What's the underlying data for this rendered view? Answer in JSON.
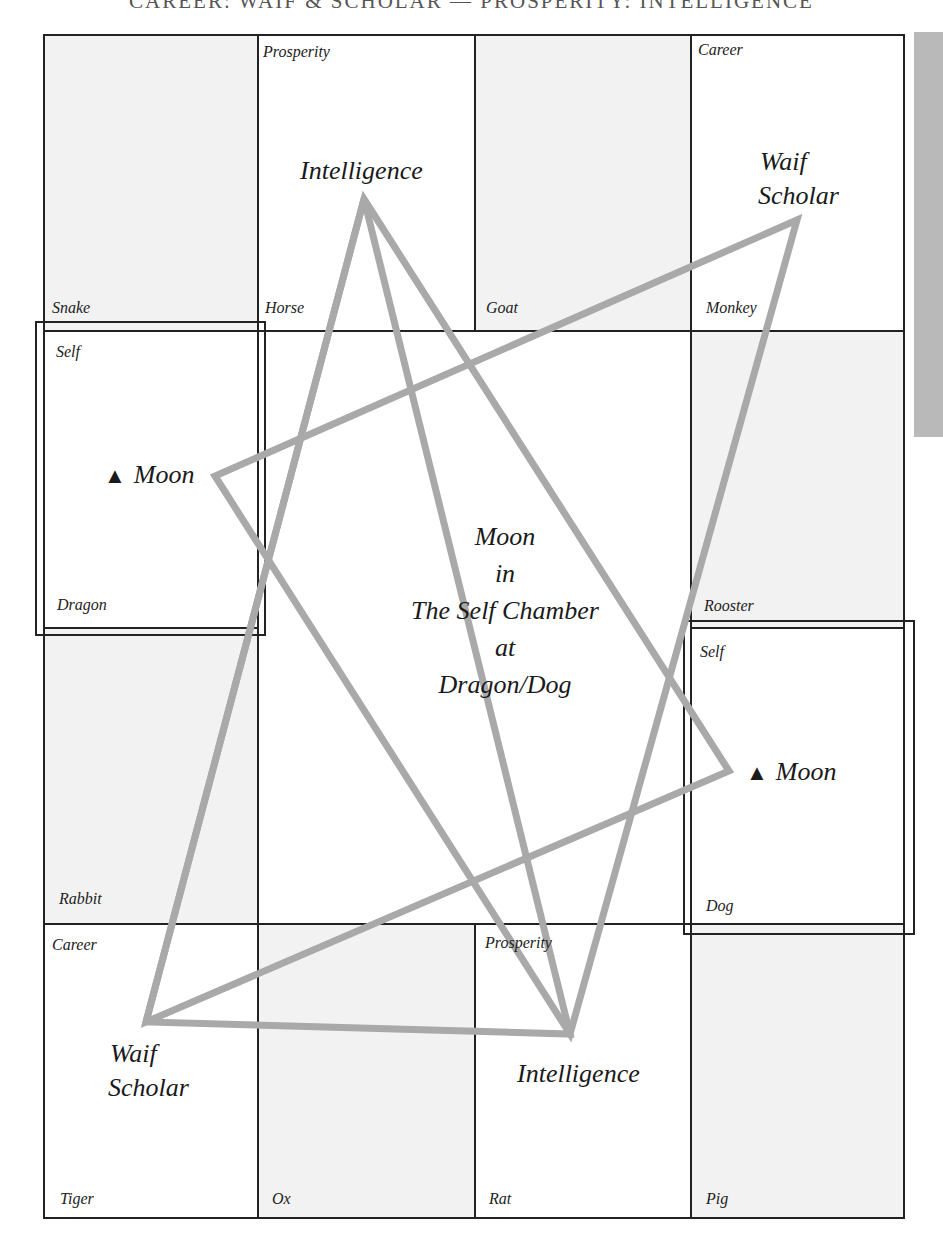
{
  "header": {
    "title": "CAREER: WAIF & SCHOLAR — PROSPERITY: INTELLIGENCE"
  },
  "grid": {
    "cells": {
      "snake": {
        "animal": "Snake"
      },
      "horse": {
        "animal": "Horse",
        "chamber": "Prosperity",
        "star": "Intelligence"
      },
      "goat": {
        "animal": "Goat"
      },
      "monkey": {
        "animal": "Monkey",
        "chamber": "Career",
        "star_line1": "Waif",
        "star_line2": "Scholar"
      },
      "dragon": {
        "animal": "Dragon",
        "chamber": "Self",
        "star": "Moon",
        "marker": "▲"
      },
      "rooster": {
        "animal": "Rooster"
      },
      "rabbit": {
        "animal": "Rabbit"
      },
      "dog": {
        "animal": "Dog",
        "chamber": "Self",
        "star": "Moon",
        "marker": "▲"
      },
      "tiger": {
        "animal": "Tiger",
        "chamber": "Career",
        "star_line1": "Waif",
        "star_line2": "Scholar"
      },
      "ox": {
        "animal": "Ox"
      },
      "rat": {
        "animal": "Rat",
        "chamber": "Prosperity",
        "star": "Intelligence"
      },
      "pig": {
        "animal": "Pig"
      }
    },
    "center": {
      "line1": "Moon",
      "line2": "in",
      "line3": "The Self Chamber",
      "line4": "at",
      "line5": "Dragon/Dog"
    }
  },
  "colors": {
    "line": "#222222",
    "shaded_cell": "#f2f2f2",
    "triangle_stroke": "#a9a9a9",
    "side_tab": "#b9b9b9"
  }
}
